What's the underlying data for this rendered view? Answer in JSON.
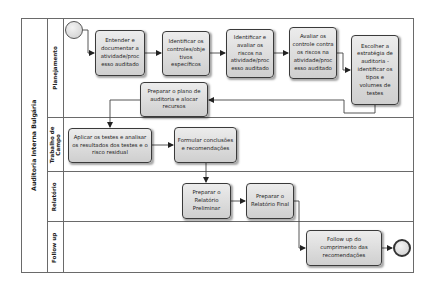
{
  "pool": {
    "title": "Auditoria Interna Bulgária"
  },
  "lanes": [
    {
      "label": "Planejamento"
    },
    {
      "label_line1": "Trabalho de",
      "label_line2": "Campo"
    },
    {
      "label": "Relatório"
    },
    {
      "label": "Follow up"
    }
  ],
  "events": {
    "start": "start-event",
    "end": "end-event"
  },
  "tasks": [
    {
      "id": "t1",
      "lane": "Planejamento",
      "text": "Entender e documentar a atividade/processo auditado",
      "lines": [
        "Entender e",
        "documentar a",
        "atividade/proc",
        "esso auditado"
      ]
    },
    {
      "id": "t2",
      "lane": "Planejamento",
      "text": "Identificar os controles/objetivos específicos",
      "lines": [
        "Identificar os",
        "controles/obje",
        "tivos",
        "específicos"
      ]
    },
    {
      "id": "t3",
      "lane": "Planejamento",
      "text": "Identificar e avaliar os riscos na atividade/processo auditado",
      "lines": [
        "Identificar e",
        "avaliar os",
        "riscos na",
        "atividade/proc",
        "esso auditado"
      ]
    },
    {
      "id": "t4",
      "lane": "Planejamento",
      "text": "Avaliar os controle contra os riscos na atividade/processo auditado",
      "lines": [
        "Avaliar os",
        "controle contra",
        "os riscos na",
        "atividade/proc",
        "esso auditado"
      ]
    },
    {
      "id": "t5",
      "lane": "Planejamento",
      "text": "Escolher a estratégia de auditoria - identificar os tipos e volumes de testes",
      "lines": [
        "Escolher a",
        "estratégia de",
        "auditoria -",
        "identificar os",
        "tipos e",
        "volumes de",
        "testes"
      ]
    },
    {
      "id": "t6",
      "lane": "Planejamento",
      "text": "Preparar o plano de auditoria e alocar recursos",
      "lines": [
        "Preparar o plano de",
        "auditoria e alocar",
        "recursos"
      ]
    },
    {
      "id": "t7",
      "lane": "Trabalho de Campo",
      "text": "Aplicar os testes e analisar os resultados dos testes e o risco residual",
      "lines": [
        "Aplicar os testes e analisar",
        "os resultados dos testes e o",
        "risco residual"
      ]
    },
    {
      "id": "t8",
      "lane": "Trabalho de Campo",
      "text": "Formular conclusões e recomendações",
      "lines": [
        "Formular conclusões",
        "e recomendações"
      ]
    },
    {
      "id": "t9",
      "lane": "Relatório",
      "text": "Preparar o Relatório Preliminar",
      "lines": [
        "Preparar o",
        "Relatório",
        "Preliminar"
      ]
    },
    {
      "id": "t10",
      "lane": "Relatório",
      "text": "Preparar o Relatório Final",
      "lines": [
        "Preparar o",
        "Relatório Final"
      ]
    },
    {
      "id": "t11",
      "lane": "Follow up",
      "text": "Follow up do cumprimento das recomendações",
      "lines": [
        "Follow up do",
        "cumprimento das",
        "recomendações"
      ]
    }
  ],
  "flows": [
    [
      "start",
      "t1"
    ],
    [
      "t1",
      "t2"
    ],
    [
      "t2",
      "t3"
    ],
    [
      "t3",
      "t4"
    ],
    [
      "t4",
      "t5"
    ],
    [
      "t5",
      "t6"
    ],
    [
      "t6",
      "t7"
    ],
    [
      "t7",
      "t8"
    ],
    [
      "t8",
      "t9"
    ],
    [
      "t9",
      "t10"
    ],
    [
      "t10",
      "t11"
    ],
    [
      "t11",
      "end"
    ]
  ],
  "colors": {
    "task_fill_top": "#ececec",
    "task_fill_bottom": "#cfcfcf",
    "task_border": "#3a3a3a",
    "lane_border": "#6a6a6a",
    "flow_line": "#444444"
  }
}
